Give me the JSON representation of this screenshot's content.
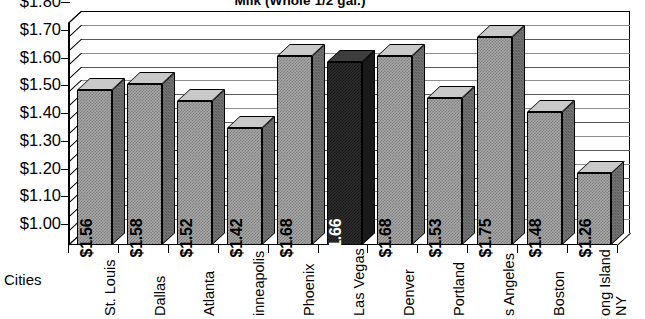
{
  "chart_data": {
    "type": "bar",
    "title": "Milk (Whole 1/2 gal.)",
    "xlabel": "Cities",
    "ylabel": "",
    "ylim": [
      1.0,
      1.8
    ],
    "ytick_step": 0.1,
    "yminor_step": 0.05,
    "grid": true,
    "legend": false,
    "style": "3d-column",
    "categories": [
      "St. Louis",
      "Dallas",
      "Atlanta",
      "inneapolis",
      "Phoenix",
      "Las Vegas",
      "Denver",
      "Portland",
      "s Angeles",
      "Boston",
      "ong Island NY"
    ],
    "values": [
      1.56,
      1.58,
      1.52,
      1.42,
      1.68,
      1.66,
      1.68,
      1.53,
      1.75,
      1.48,
      1.26
    ],
    "data_labels": [
      "$1.56",
      "$1.58",
      "$1.52",
      "$1.42",
      "$1.68",
      "$1.66",
      "$1.68",
      "$1.53",
      "$1.75",
      "$1.48",
      "$1.26"
    ],
    "highlight_index": 5,
    "ytick_labels": [
      "$1.80",
      "$1.70",
      "$1.60",
      "$1.50",
      "$1.40",
      "$1.30",
      "$1.20",
      "$1.10",
      "$1.00"
    ],
    "ytick_values": [
      1.8,
      1.7,
      1.6,
      1.5,
      1.4,
      1.3,
      1.2,
      1.1,
      1.0
    ],
    "category_labels_multiline": {
      "10": [
        "ong Island",
        "NY"
      ]
    },
    "colors": {
      "bar_fill": "#a8a8a8",
      "bar_highlight": "#2e2e2e",
      "bar_top": "#c9c9c9",
      "bar_side": "#787878",
      "outline": "#000000",
      "gridline": "#5a5a5a",
      "background": "#ffffff",
      "text": "#000000",
      "highlight_text": "#ffffff"
    }
  }
}
